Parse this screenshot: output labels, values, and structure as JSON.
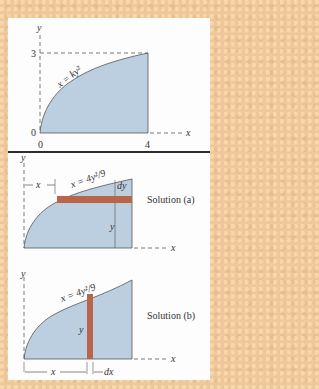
{
  "colors": {
    "background": "#eec89a",
    "panel": "#fdfdfd",
    "region_fill": "#bccfe0",
    "strip_fill": "#b8654a",
    "line": "#444444",
    "divider": "#2b2b2b"
  },
  "panel1": {
    "y_axis_label": "y",
    "x_axis_label": "x",
    "curve_label": "x = ky²",
    "y_tick_top": "3",
    "y_tick_origin": "0",
    "x_tick_origin": "0",
    "x_tick_end": "4"
  },
  "panel2": {
    "solution_a": {
      "caption": "Solution (a)",
      "curve_label": "x = 4y²/9",
      "y_axis_label": "y",
      "x_axis_label": "x",
      "x_dim_label": "x",
      "dy_label": "dy",
      "y_dim_label": "y"
    },
    "solution_b": {
      "caption": "Solution (b)",
      "curve_label": "x = 4y²/9",
      "y_axis_label": "y",
      "x_axis_label": "x",
      "y_dim_label": "y",
      "x_dim_label": "x",
      "dx_label": "dx"
    }
  }
}
